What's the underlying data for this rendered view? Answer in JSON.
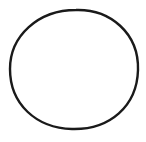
{
  "canvas": {
    "width": 146,
    "height": 142,
    "background": "#ffffff"
  },
  "shape": {
    "type": "hand-drawn-circle",
    "cx": 74,
    "cy": 69,
    "rx": 64,
    "ry": 60,
    "stroke": "#1a1a1a",
    "stroke_width": 2.4
  }
}
